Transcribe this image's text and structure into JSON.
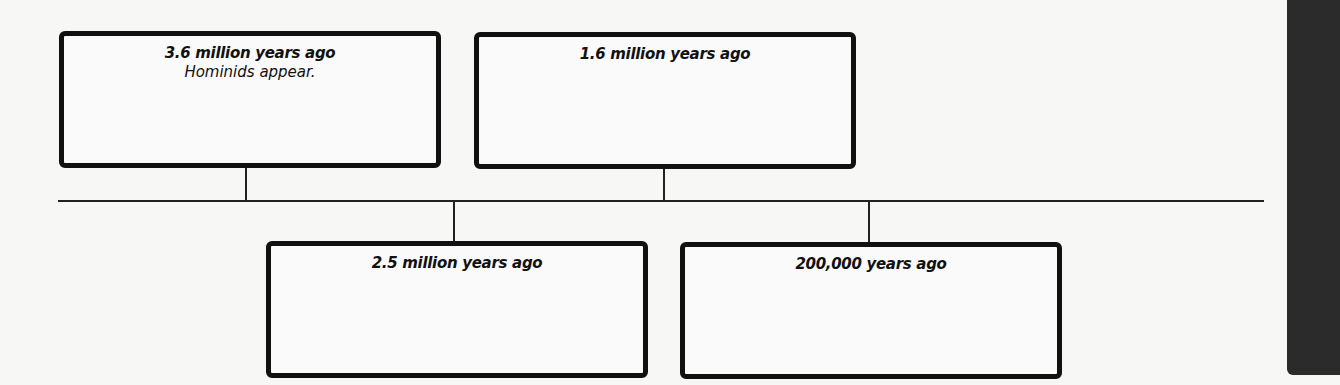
{
  "timeline": {
    "events": [
      {
        "date": "3.6 million years ago",
        "description": "Hominids appear.",
        "position": "above"
      },
      {
        "date": "2.5 million years ago",
        "description": "",
        "position": "below"
      },
      {
        "date": "1.6 million years ago",
        "description": "",
        "position": "above"
      },
      {
        "date": "200,000 years ago",
        "description": "",
        "position": "below"
      }
    ]
  },
  "colors": {
    "line": "#222222",
    "box_border": "#111111",
    "side_tab": "#2b2b2b"
  }
}
